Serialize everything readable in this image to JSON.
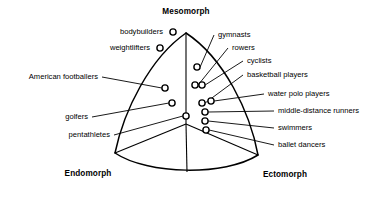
{
  "chart_data": {
    "type": "scatter",
    "xlabel": "",
    "ylabel": "",
    "grid": false,
    "legend_position": "none",
    "axes": {
      "kind": "ternary-somatochart",
      "shape": "curved triangle (Reuleaux-style somatochart)",
      "vertices": [
        {
          "name": "Mesomorph",
          "label": "Mesomorph",
          "position": "top",
          "x": 186,
          "y": 33,
          "label_x": 186,
          "label_y": 14
        },
        {
          "name": "Endomorph",
          "label": "Endomorph",
          "position": "bottom-left",
          "x": 115,
          "y": 153,
          "label_x": 88,
          "label_y": 176
        },
        {
          "name": "Ectomorph",
          "label": "Ectomorph",
          "position": "bottom-right",
          "x": 258,
          "y": 155,
          "label_x": 285,
          "label_y": 177
        }
      ],
      "center": {
        "x": 186,
        "y": 124
      }
    },
    "categories": [
      "bodybuilders",
      "weightlifters",
      "American footballers",
      "golfers",
      "pentathletes",
      "gymnasts",
      "rowers",
      "cyclists",
      "basketball players",
      "water polo players",
      "middle-distance runners",
      "swimmers",
      "ballet dancers"
    ],
    "points": [
      {
        "label": "bodybuilders",
        "x": 173,
        "y": 32,
        "label_x": 163,
        "label_y": 34,
        "label_anchor": "end",
        "leader": false
      },
      {
        "label": "weightlifters",
        "x": 160,
        "y": 48,
        "label_x": 150,
        "label_y": 50,
        "label_anchor": "end",
        "leader": false
      },
      {
        "label": "American footballers",
        "x": 165,
        "y": 88,
        "label_x": 98,
        "label_y": 79,
        "label_anchor": "end",
        "leader": true
      },
      {
        "label": "golfers",
        "x": 172,
        "y": 103,
        "label_x": 88,
        "label_y": 119,
        "label_anchor": "end",
        "leader": true
      },
      {
        "label": "pentathletes",
        "x": 186,
        "y": 116,
        "label_x": 110,
        "label_y": 137,
        "label_anchor": "end",
        "leader": true
      },
      {
        "label": "gymnasts",
        "x": 197,
        "y": 67,
        "label_x": 218,
        "label_y": 37,
        "label_anchor": "start",
        "leader": true
      },
      {
        "label": "rowers",
        "x": 195,
        "y": 85,
        "label_x": 232,
        "label_y": 50,
        "label_anchor": "start",
        "leader": true
      },
      {
        "label": "cyclists",
        "x": 202,
        "y": 85,
        "label_x": 247,
        "label_y": 63,
        "label_anchor": "start",
        "leader": true
      },
      {
        "label": "basketball players",
        "x": 202,
        "y": 103,
        "label_x": 247,
        "label_y": 77,
        "label_anchor": "start",
        "leader": true
      },
      {
        "label": "water polo players",
        "x": 211,
        "y": 101,
        "label_x": 268,
        "label_y": 96,
        "label_anchor": "start",
        "leader": true
      },
      {
        "label": "middle-distance runners",
        "x": 205,
        "y": 112,
        "label_x": 278,
        "label_y": 113,
        "label_anchor": "start",
        "leader": true
      },
      {
        "label": "swimmers",
        "x": 205,
        "y": 121,
        "label_x": 278,
        "label_y": 130,
        "label_anchor": "start",
        "leader": true
      },
      {
        "label": "ballet dancers",
        "x": 206,
        "y": 130,
        "label_x": 278,
        "label_y": 147,
        "label_anchor": "start",
        "leader": true
      }
    ],
    "marker": {
      "shape": "open-circle",
      "radius": 3.1,
      "fill": "#ffffff",
      "stroke": "#000000"
    },
    "colors": {
      "line": "#000000",
      "background": "#ffffff",
      "text": "#000000"
    }
  }
}
